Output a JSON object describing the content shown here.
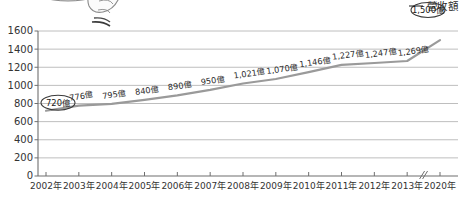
{
  "legend": {
    "series_label": "營收額",
    "swatch_name": "line-swatch"
  },
  "highlight": {
    "first_label": "720億",
    "last_label": "1,500億"
  },
  "axis_break": {
    "present": true,
    "between": [
      "2013年",
      "2020年"
    ]
  },
  "chart_data": {
    "type": "line",
    "title": "",
    "subtitle": "",
    "xlabel": "",
    "ylabel": "",
    "legend_position": "top-right",
    "grid": true,
    "ylim": [
      0,
      1600
    ],
    "ytick_step": 200,
    "yticks": [
      "0",
      "200",
      "400",
      "600",
      "800",
      "1000",
      "1200",
      "1400",
      "1600"
    ],
    "categories": [
      "2002年",
      "2003年",
      "2004年",
      "2005年",
      "2006年",
      "2007年",
      "2008年",
      "2009年",
      "2010年",
      "2011年",
      "2012年",
      "2013年",
      "2020年"
    ],
    "values": [
      720,
      776,
      795,
      840,
      890,
      950,
      1021,
      1070,
      1146,
      1227,
      1247,
      1269,
      1500
    ],
    "point_labels": [
      "720億",
      "776億",
      "795億",
      "840億",
      "890億",
      "950億",
      "1,021億",
      "1,070億",
      "1,146億",
      "1,227億",
      "1,247億",
      "1,269億",
      "1,500億"
    ],
    "series": [
      {
        "name": "營收額",
        "color": "#9a9a9a",
        "values": [
          720,
          776,
          795,
          840,
          890,
          950,
          1021,
          1070,
          1146,
          1227,
          1247,
          1269,
          1500
        ]
      }
    ],
    "note": "x-axis has a break between 2013年 and 2020年"
  },
  "colors": {
    "line": "#9a9a9a",
    "grid": "#b7b7b7",
    "axis": "#6f6f6f",
    "text": "#2b2b2b",
    "background": "#ffffff"
  }
}
